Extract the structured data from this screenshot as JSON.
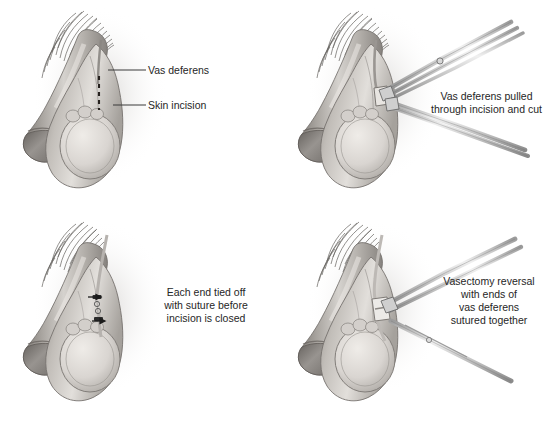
{
  "figure": {
    "background_color": "#ffffff",
    "text_color": "#262626",
    "layout": "2x2 grid of grayscale medical illustrations",
    "columns": 2,
    "rows": 2
  },
  "panels": [
    {
      "id": "top-left",
      "step": "1",
      "subject": "male-genital-anatomy-with-incision-markings",
      "labels": [
        {
          "id": "vas-deferens",
          "text": "Vas deferens"
        },
        {
          "id": "skin-incision",
          "text": "Skin incision"
        }
      ],
      "annotations": {
        "dashed_line": "skin incision line",
        "leader_lines": 2
      },
      "caption": ""
    },
    {
      "id": "top-right",
      "step": "2",
      "subject": "male-genital-anatomy-with-surgical-forceps",
      "labels": [],
      "annotations": {
        "instruments": "two hemostat forceps",
        "leader_lines": 0
      },
      "caption": "Vas deferens pulled\nthrough incision and cut"
    },
    {
      "id": "bottom-left",
      "step": "3",
      "subject": "male-genital-anatomy-with-sutured-vas-ends",
      "labels": [],
      "annotations": {
        "sutures": 2,
        "arrows": 2,
        "leader_lines": 0
      },
      "caption": "Each end tied off\nwith suture before\nincision is closed"
    },
    {
      "id": "bottom-right",
      "step": "4",
      "subject": "male-genital-anatomy-with-needle-holder-and-suture-needle",
      "labels": [],
      "annotations": {
        "instruments": "needle holder and curved suture needle",
        "leader_lines": 0
      },
      "caption": "Vasectomy reversal\nwith ends of\nvas deferens\nsutured together"
    }
  ],
  "colors": {
    "skin_light": "#e9e6e2",
    "skin_mid": "#bdb9b4",
    "skin_dark": "#8e8a86",
    "shadow": "#6e6a66",
    "hair": "#4a4744",
    "instrument_light": "#e3e3e3",
    "instrument_mid": "#b5b5b5",
    "instrument_dark": "#7d7d7d",
    "line": "#3a3a3a",
    "background": "#ffffff"
  }
}
